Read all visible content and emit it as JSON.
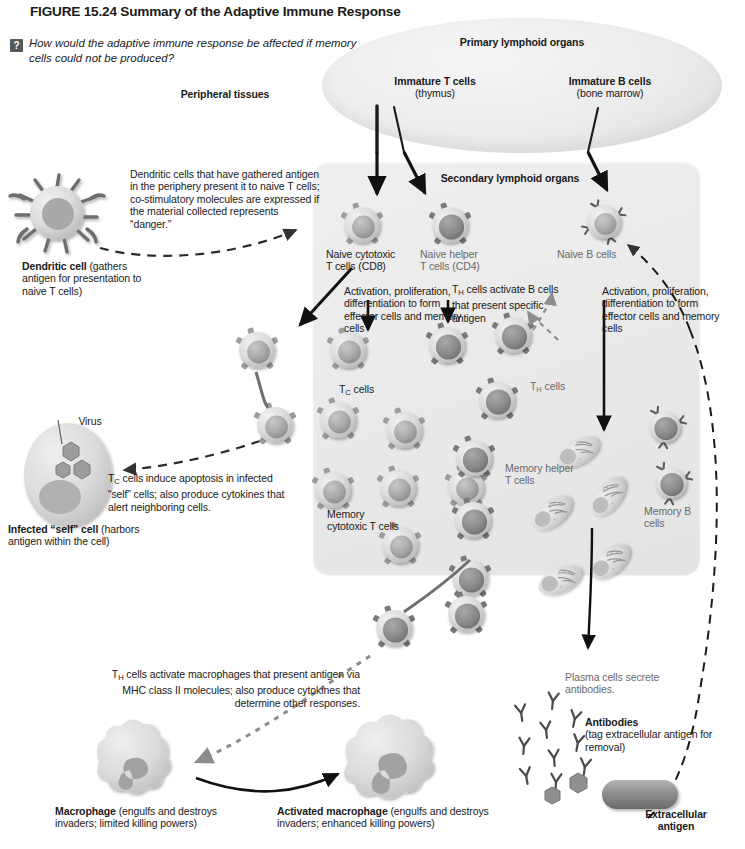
{
  "figure": {
    "number_title": "FIGURE 15.24  Summary of the Adaptive Immune Response",
    "question_icon": "?",
    "question": "How would the adaptive immune response be affected if memory cells could not be produced?"
  },
  "regions": {
    "primary_lymphoid": "Primary lymphoid organs",
    "secondary_lymphoid": "Secondary lymphoid organs",
    "peripheral_tissues": "Peripheral tissues"
  },
  "primary_cells": {
    "immature_t": "Immature T cells",
    "immature_t_site": "(thymus)",
    "immature_b": "Immature B cells",
    "immature_b_site": "(bone marrow)"
  },
  "dendritic": {
    "description": "Dendritic cells that have gathered antigen in the periphery present it to naive T cells; co-stimulatory molecules are expressed if the material collected represents “danger.”",
    "label": "Dendritic cell",
    "caption": "(gathers antigen for presentation to naive T cells)"
  },
  "infected_cell": {
    "virus_label": "Virus",
    "label": "Infected “self” cell",
    "caption": "(harbors antigen within the cell)",
    "apoptosis_text": "T",
    "apoptosis_sub": "C",
    "apoptosis_rest": " cells induce apoptosis in infected “self” cells; also produce cytokines that alert neighboring cells."
  },
  "naive_cells": {
    "cytotoxic_l1": "Naive cytotoxic",
    "cytotoxic_l2": "T cells (CD8)",
    "helper_l1": "Naive helper",
    "helper_l2": "T cells (CD4)",
    "b_cells": "Naive B cells"
  },
  "activation": {
    "left": "Activation, proliferation, differentiation to form effector cells and memory cells",
    "right": "Activation, proliferation, differentiation to form effector cells and memory cells",
    "th_activate_b_pre": "T",
    "th_activate_b_sub": "H",
    "th_activate_b_rest": " cells activate B cells that present specific antigen"
  },
  "effector_labels": {
    "tc_pre": "T",
    "tc_sub": "C",
    "tc_rest": " cells",
    "th_pre": "T",
    "th_sub": "H",
    "th_rest": " cells",
    "memory_helper": "Memory helper T cells",
    "memory_cytotoxic": "Memory cytotoxic T cells",
    "memory_b": "Memory B cells"
  },
  "macrophage_path": {
    "text_pre": "T",
    "text_sub": "H",
    "text_rest": " cells activate macrophages that present antigen via MHC class II molecules; also produce cytokines that determine other responses.",
    "macrophage_bold": "Macrophage",
    "macrophage_rest": " (engulfs and destroys invaders; limited killing powers)",
    "activated_bold": "Activated macrophage",
    "activated_rest": " (engulfs and destroys invaders; enhanced killing powers)"
  },
  "humoral": {
    "plasma_secrete": "Plasma cells secrete antibodies.",
    "antibodies_bold": "Antibodies",
    "antibodies_rest": "(tag extracellular antigen for removal)",
    "extracellular_antigen": "Extracellular antigen"
  },
  "colors": {
    "box_bg": "#eaeaea",
    "oval_bg": "#ececec",
    "cell_light": "#d8d8d8",
    "cell_dark": "#9a9a9a",
    "line": "#1a1a1a",
    "icon_bg": "#58595b"
  }
}
